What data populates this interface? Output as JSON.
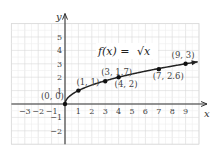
{
  "chart_data": {
    "type": "line",
    "title": "f(x) = √x",
    "function": "sqrt(x)",
    "xlabel": "x",
    "ylabel": "y",
    "xlim": [
      -4,
      10
    ],
    "ylim": [
      -3,
      6
    ],
    "grid": true,
    "x_ticks": [
      "-3",
      "-2",
      "-1",
      "1",
      "2",
      "3",
      "4",
      "5",
      "6",
      "7",
      "8",
      "9"
    ],
    "y_ticks": [
      "-2",
      "-1",
      "1",
      "2",
      "3",
      "4",
      "5"
    ],
    "points": [
      {
        "x": 0,
        "y": 0,
        "label": "(0, 0)"
      },
      {
        "x": 1,
        "y": 1,
        "label": "(1, 1)"
      },
      {
        "x": 3,
        "y": 1.7,
        "label": "(3, 1.7)"
      },
      {
        "x": 4,
        "y": 2,
        "label": "(4, 2)"
      },
      {
        "x": 7,
        "y": 2.6,
        "label": "(7, 2.6)"
      },
      {
        "x": 9,
        "y": 3,
        "label": "(9, 3)"
      }
    ],
    "legend": {
      "text_left": "f(x) = ",
      "text_radical": "√x"
    },
    "colors": {
      "curve": "#222222",
      "grid": "#d9d9d9",
      "axis": "#333333"
    }
  }
}
